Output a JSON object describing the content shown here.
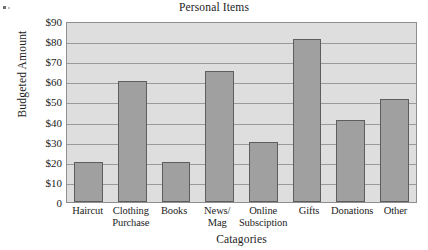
{
  "chart_data": {
    "type": "bar",
    "title": "Personal Items",
    "xlabel": "Catagories",
    "ylabel": "Budgeted Amount",
    "categories": [
      "Haircut",
      "Clothing Purchase",
      "Books",
      "News/ Mag",
      "Online Subsciption",
      "Gifts",
      "Donations",
      "Other"
    ],
    "category_lines": [
      [
        "Haircut",
        ""
      ],
      [
        "Clothing",
        "Purchase"
      ],
      [
        "Books",
        ""
      ],
      [
        "News/",
        "Mag"
      ],
      [
        "Online",
        "Subsciption"
      ],
      [
        "Gifts",
        ""
      ],
      [
        "Donations",
        ""
      ],
      [
        "Other",
        ""
      ]
    ],
    "values": [
      20,
      60,
      20,
      65,
      30,
      81,
      41,
      51
    ],
    "ylim": [
      0,
      90
    ],
    "ytick_values": [
      0,
      10,
      20,
      30,
      40,
      50,
      60,
      70,
      80,
      90
    ],
    "ytick_labels": [
      "0",
      "$10",
      "$20",
      "$30",
      "$40",
      "$50",
      "$60",
      "$70",
      "$80",
      "$90"
    ],
    "grid": true,
    "legend": false,
    "bar_fill_color": "#a0a0a0",
    "bar_edge_color": "#5e5e5e",
    "plot_background_color": "#dedede",
    "gridline_color": "#9a9a9a"
  }
}
